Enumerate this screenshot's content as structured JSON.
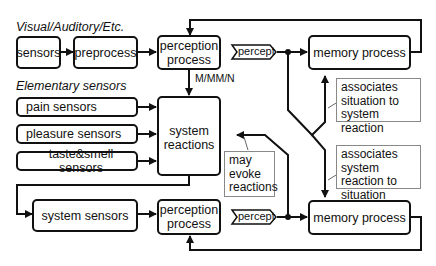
{
  "headings": {
    "visual": "Visual/Auditory/Etc.",
    "elementary": "Elementary sensors"
  },
  "boxes": {
    "sensors": "sensors",
    "preprocess": "preprocess",
    "perception_top": "perception process",
    "memory_top": "memory process",
    "pain": "pain sensors",
    "pleasure": "pleasure sensors",
    "taste": "taste&smell sensors",
    "system_reactions": "system reactions",
    "system_sensors": "system sensors",
    "perception_bottom": "perception process",
    "memory_bottom": "memory process"
  },
  "labels": {
    "percept_top": "percept",
    "percept_bottom": "percept",
    "mmm": "M/MM/N"
  },
  "notes": {
    "assoc_top": "associates situation to system reaction",
    "may_evoke": "may evoke reactions",
    "assoc_bottom": "associates system reaction to situation"
  }
}
